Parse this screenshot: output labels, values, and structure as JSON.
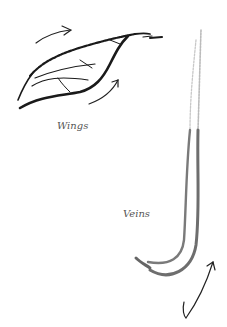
{
  "illustration": {
    "labels": {
      "wings": "Wings",
      "veins": "Veins"
    },
    "colors": {
      "leaf_stroke": "#1a1a1a",
      "vein_stroke": "#6e6e6e",
      "vein_light": "#b5b5b5",
      "arrow": "#222222",
      "label": "#555555",
      "background": "#ffffff"
    },
    "icons": [
      "leaf-sketch",
      "curved-arrow",
      "curved-arrow",
      "hook-arrow",
      "vein-strokes"
    ]
  }
}
